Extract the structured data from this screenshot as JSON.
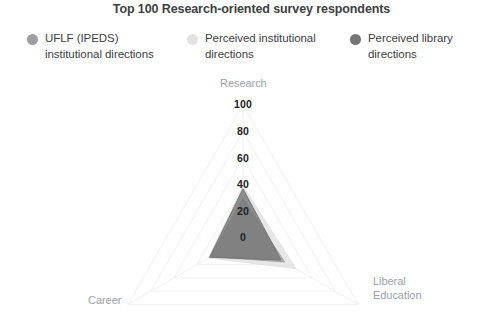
{
  "title": "Top 100 Research-oriented survey respondents",
  "legend": {
    "items": [
      {
        "label_line1": "UFLF (IPEDS)",
        "label_line2": "institutional directions",
        "color": "#9e9e9e",
        "name": "uflf-ipeds-institutional-directions"
      },
      {
        "label_line1": "Perceived institutional",
        "label_line2": "directions",
        "color": "#e3e3e3",
        "name": "perceived-institutional-directions"
      },
      {
        "label_line1": "Perceived library",
        "label_line2": "directions",
        "color": "#757575",
        "name": "perceived-library-directions"
      }
    ]
  },
  "chart_data": {
    "type": "radar",
    "title": "Top 100 Research-oriented survey respondents",
    "axes": [
      "Research",
      "Liberal Education",
      "Career"
    ],
    "axis_label_lines": {
      "research": [
        "Research"
      ],
      "liberal_education": [
        "Liberal",
        "Education"
      ],
      "career": [
        "Career"
      ]
    },
    "tick_labels": [
      "0",
      "20",
      "40",
      "60",
      "80",
      "100"
    ],
    "tick_values": [
      0,
      20,
      40,
      60,
      80,
      100
    ],
    "radial_axis": "Research",
    "rlim": [
      0,
      100
    ],
    "grid": true,
    "legend_position": "top",
    "series": [
      {
        "name": "UFLF (IPEDS) institutional directions",
        "color": "#9e9e9e",
        "values": {
          "Research": 30,
          "Liberal Education": 36,
          "Career": 28
        }
      },
      {
        "name": "Perceived institutional directions",
        "color": "#e3e3e3",
        "values": {
          "Research": 39,
          "Liberal Education": 46,
          "Career": 30
        }
      },
      {
        "name": "Perceived library directions",
        "color": "#757575",
        "values": {
          "Research": 37,
          "Liberal Education": 33,
          "Career": 29
        }
      }
    ]
  },
  "ticks": [
    {
      "text": "100",
      "top": 98
    },
    {
      "text": "80",
      "top": 125
    },
    {
      "text": "60",
      "top": 152
    },
    {
      "text": "40",
      "top": 178
    },
    {
      "text": "20",
      "top": 205
    },
    {
      "text": "0",
      "top": 231
    }
  ]
}
